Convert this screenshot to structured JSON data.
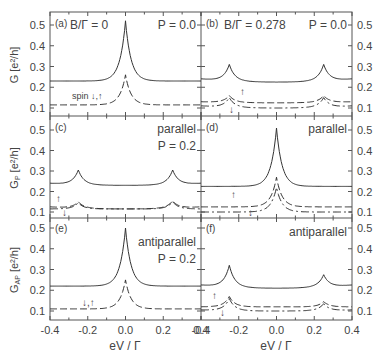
{
  "figure": {
    "xlabel": "eV / Γ",
    "xticks": [
      "-0.4",
      "-0.2",
      "0.0",
      "0.2",
      "0.4"
    ],
    "yticks": [
      "0.1",
      "0.2",
      "0.3",
      "0.4",
      "0.5"
    ],
    "ylabels": {
      "row1": "G [e²/h]",
      "row2_main": "G",
      "row2_sub": "P",
      "row3_main": "G",
      "row3_sub": "AP",
      "unit": " [e²/h]"
    },
    "colors": {
      "line": "#333333",
      "frame": "#555555",
      "text": "#444444"
    }
  },
  "panels": {
    "a": {
      "tag": "(a)",
      "title": "B/Γ = 0",
      "right": "P = 0.0",
      "spin": "spin ↓,↑"
    },
    "b": {
      "tag": "(b)",
      "title": "B/Γ = 0.278",
      "right": "P = 0.0",
      "up": "↑",
      "down": "↓"
    },
    "c": {
      "tag": "(c)",
      "right": "parallel",
      "right2": "P = 0.2",
      "up": "↑",
      "down": "↓"
    },
    "d": {
      "tag": "(d)",
      "right": "parallel",
      "up": "↑",
      "down": "↓"
    },
    "e": {
      "tag": "(e)",
      "right": "antiparallel",
      "right2": "P = 0.2",
      "spin": "↓,↑"
    },
    "f": {
      "tag": "(f)",
      "right": "antiparallel",
      "up": "↑",
      "down": "↓"
    }
  },
  "chart_data": [
    {
      "panel": "a",
      "type": "line",
      "title": "B/Γ = 0, P = 0.0",
      "xlabel": "eV / Γ",
      "ylabel": "G [e²/h]",
      "xlim": [
        -0.4,
        0.4
      ],
      "ylim": [
        0.07,
        0.56
      ],
      "series": [
        {
          "name": "total",
          "style": "solid",
          "peaks": [
            {
              "x": 0.0,
              "y": 0.52
            }
          ],
          "edge_y": 0.23
        },
        {
          "name": "spin ↓,↑",
          "style": "dashed",
          "peaks": [
            {
              "x": 0.0,
              "y": 0.26
            }
          ],
          "edge_y": 0.115
        }
      ]
    },
    {
      "panel": "b",
      "type": "line",
      "title": "B/Γ = 0.278, P = 0.0",
      "xlim": [
        -0.4,
        0.4
      ],
      "ylim": [
        0.07,
        0.56
      ],
      "series": [
        {
          "name": "total",
          "style": "solid",
          "peaks": [
            {
              "x": -0.25,
              "y": 0.31
            },
            {
              "x": 0.25,
              "y": 0.31
            }
          ],
          "edge_y": 0.24,
          "center_y": 0.225
        },
        {
          "name": "↑",
          "style": "dashed",
          "peaks": [
            {
              "x": -0.25,
              "y": 0.16
            },
            {
              "x": 0.25,
              "y": 0.16
            }
          ],
          "edge_y": 0.13,
          "center_y": 0.125
        },
        {
          "name": "↓",
          "style": "dash-dot",
          "peaks": [
            {
              "x": -0.25,
              "y": 0.15
            },
            {
              "x": 0.25,
              "y": 0.15
            }
          ],
          "edge_y": 0.11,
          "center_y": 0.1
        }
      ]
    },
    {
      "panel": "c",
      "type": "line",
      "title": "parallel, P = 0.2",
      "ylabel": "G_P [e²/h]",
      "xlim": [
        -0.4,
        0.4
      ],
      "ylim": [
        0.07,
        0.56
      ],
      "series": [
        {
          "name": "total",
          "style": "solid",
          "peaks": [
            {
              "x": -0.25,
              "y": 0.305
            },
            {
              "x": 0.25,
              "y": 0.305
            }
          ],
          "edge_y": 0.24,
          "center_y": 0.23
        },
        {
          "name": "↑",
          "style": "dashed",
          "peaks": [
            {
              "x": -0.25,
              "y": 0.15
            },
            {
              "x": 0.25,
              "y": 0.155
            }
          ],
          "edge_y": 0.125,
          "center_y": 0.115
        },
        {
          "name": "↓",
          "style": "dash-dot",
          "peaks": [
            {
              "x": -0.25,
              "y": 0.145
            },
            {
              "x": 0.25,
              "y": 0.15
            }
          ],
          "edge_y": 0.115,
          "center_y": 0.115
        }
      ]
    },
    {
      "panel": "d",
      "type": "line",
      "title": "parallel",
      "xlim": [
        -0.4,
        0.4
      ],
      "ylim": [
        0.07,
        0.56
      ],
      "series": [
        {
          "name": "total",
          "style": "solid",
          "peaks": [
            {
              "x": 0.0,
              "y": 0.51
            }
          ],
          "edge_y": 0.225
        },
        {
          "name": "↑",
          "style": "dashed",
          "peaks": [
            {
              "x": 0.0,
              "y": 0.27
            }
          ],
          "edge_y": 0.125
        },
        {
          "name": "↓",
          "style": "dash-dot",
          "peaks": [
            {
              "x": 0.0,
              "y": 0.22
            }
          ],
          "edge_y": 0.1
        }
      ]
    },
    {
      "panel": "e",
      "type": "line",
      "title": "antiparallel, P = 0.2",
      "ylabel": "G_AP [e²/h]",
      "xlim": [
        -0.4,
        0.4
      ],
      "ylim": [
        0.07,
        0.56
      ],
      "series": [
        {
          "name": "total",
          "style": "solid",
          "peaks": [
            {
              "x": 0.0,
              "y": 0.5
            }
          ],
          "edge_y": 0.22
        },
        {
          "name": "↓,↑",
          "style": "dashed",
          "peaks": [
            {
              "x": 0.0,
              "y": 0.25
            }
          ],
          "edge_y": 0.11
        }
      ]
    },
    {
      "panel": "f",
      "type": "line",
      "title": "antiparallel",
      "xlim": [
        -0.4,
        0.4
      ],
      "ylim": [
        0.07,
        0.56
      ],
      "series": [
        {
          "name": "total",
          "style": "solid",
          "peaks": [
            {
              "x": -0.25,
              "y": 0.32
            },
            {
              "x": 0.25,
              "y": 0.275
            }
          ],
          "edge_y": 0.225,
          "center_y": 0.21
        },
        {
          "name": "↑",
          "style": "dashed",
          "peaks": [
            {
              "x": -0.25,
              "y": 0.17
            },
            {
              "x": 0.25,
              "y": 0.145
            }
          ],
          "edge_y": 0.12,
          "center_y": 0.12
        },
        {
          "name": "↓",
          "style": "dash-dot",
          "peaks": [
            {
              "x": -0.25,
              "y": 0.16
            },
            {
              "x": 0.25,
              "y": 0.135
            }
          ],
          "edge_y": 0.105,
          "center_y": 0.1
        }
      ]
    }
  ]
}
